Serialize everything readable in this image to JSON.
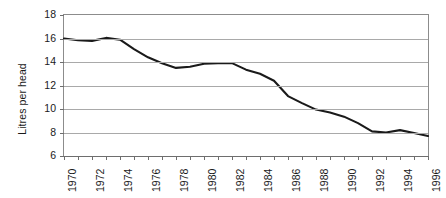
{
  "chart_data": {
    "type": "line",
    "title": "",
    "xlabel": "",
    "ylabel": "Litres per head",
    "ylim": [
      6,
      18
    ],
    "yticks": [
      18,
      16,
      14,
      12,
      10,
      8,
      6
    ],
    "xlim": [
      1970,
      1996
    ],
    "grid": "horizontal",
    "legend": "none",
    "line_color": "#1a1a1a",
    "x": [
      1970,
      1971,
      1972,
      1973,
      1974,
      1975,
      1976,
      1977,
      1978,
      1979,
      1980,
      1981,
      1982,
      1983,
      1984,
      1985,
      1986,
      1987,
      1988,
      1989,
      1990,
      1991,
      1992,
      1993,
      1994,
      1995,
      1996
    ],
    "xticklabels": [
      "1970",
      "",
      "1972",
      "",
      "1974",
      "",
      "1976",
      "",
      "1978",
      "",
      "1980",
      "",
      "1982",
      "",
      "1984",
      "",
      "1986",
      "",
      "1988",
      "",
      "1990",
      "",
      "1992",
      "",
      "1994",
      "",
      "1996"
    ],
    "series": [
      {
        "name": "Litres per head",
        "values": [
          16.0,
          15.85,
          15.8,
          16.05,
          15.9,
          15.1,
          14.4,
          13.9,
          13.5,
          13.6,
          13.85,
          13.9,
          13.9,
          13.35,
          13.0,
          12.4,
          11.1,
          10.5,
          9.95,
          9.7,
          9.35,
          8.8,
          8.1,
          8.0,
          8.2,
          7.95,
          7.7
        ]
      }
    ]
  }
}
